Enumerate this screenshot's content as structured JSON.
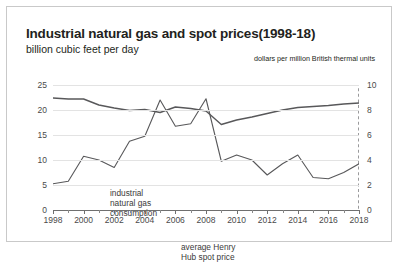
{
  "chart_title": "Industrial natural gas and spot prices(1998-18)",
  "subtitle_left": "billion cubic feet per day",
  "subtitle_right": "dollars per million British thermal units",
  "labels": {
    "consumption": "industrial\nnatural gas\nconsumption",
    "spot": "average Henry\nHub spot price"
  },
  "colors": {
    "line": "#58585a",
    "grid": "#e3e3e3",
    "axis": "#6f6f6f",
    "text": "#231f20",
    "border": "#c9c9c9"
  },
  "chart_data": {
    "type": "line",
    "title": "Industrial natural gas and spot prices(1998-18)",
    "xlabel": "",
    "ylabel": "billion cubic feet per day",
    "y2label": "dollars per million British thermal units",
    "ylim": [
      0,
      25
    ],
    "y2lim": [
      0,
      10
    ],
    "yticks": [
      0,
      5,
      10,
      15,
      20,
      25
    ],
    "y2ticks": [
      0,
      2,
      4,
      6,
      8,
      10
    ],
    "xticks": [
      1998,
      2000,
      2002,
      2004,
      2006,
      2008,
      2010,
      2012,
      2014,
      2016,
      2018
    ],
    "xlim": [
      1998,
      2018
    ],
    "grid": true,
    "legend": "inline-annotations",
    "annotations": [
      {
        "text": "industrial natural gas consumption",
        "x": 2000.5,
        "y": 18.0
      },
      {
        "text": "average Henry Hub spot price",
        "x": 2007.5,
        "y": 7.4
      }
    ],
    "x": [
      1998,
      1999,
      2000,
      2001,
      2002,
      2003,
      2004,
      2005,
      2006,
      2007,
      2008,
      2009,
      2010,
      2011,
      2012,
      2013,
      2014,
      2015,
      2016,
      2017,
      2018
    ],
    "series": [
      {
        "name": "industrial natural gas consumption",
        "axis": "left",
        "units": "billion cubic feet per day",
        "values": [
          22.4,
          22.2,
          22.2,
          21.0,
          20.4,
          19.9,
          20.1,
          19.5,
          20.6,
          20.3,
          19.8,
          17.1,
          18.0,
          18.6,
          19.3,
          20.0,
          20.5,
          20.7,
          20.9,
          21.2,
          21.4
        ]
      },
      {
        "name": "average Henry Hub spot price",
        "axis": "right",
        "units": "dollars per million British thermal units",
        "values": [
          2.1,
          2.3,
          4.3,
          4.0,
          3.4,
          5.5,
          5.9,
          8.8,
          6.7,
          6.9,
          8.9,
          3.9,
          4.4,
          4.0,
          2.8,
          3.7,
          4.4,
          2.6,
          2.5,
          3.0,
          3.7
        ]
      }
    ],
    "markers": [
      {
        "type": "vertical-dashed-line",
        "x": 2018,
        "label": "2018"
      }
    ]
  }
}
